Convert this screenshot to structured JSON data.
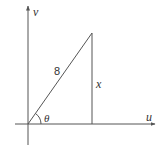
{
  "diagram": {
    "type": "right-triangle-on-axes",
    "axes": {
      "horizontal_label": "u",
      "vertical_label": "v"
    },
    "triangle": {
      "hypotenuse_label": "8",
      "vertical_side_label": "x",
      "angle_label": "θ"
    },
    "colors": {
      "stroke": "#555555",
      "text": "#333333",
      "background": "#ffffff"
    }
  }
}
